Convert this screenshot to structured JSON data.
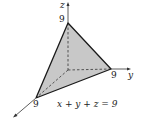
{
  "diagram": {
    "axes": {
      "z_label": "z",
      "y_label": "y",
      "x_label": ""
    },
    "intercepts": {
      "z": "9",
      "y": "9",
      "x": "9"
    },
    "equation": "x + y + z = 9",
    "colors": {
      "plane_fill": "#c8c8c8",
      "edge": "#1a1a1a",
      "axis": "#333333"
    }
  }
}
